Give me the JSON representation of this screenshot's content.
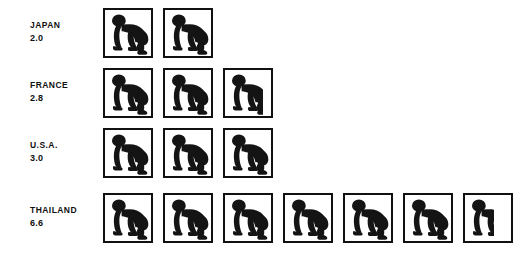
{
  "chart_data": {
    "type": "bar",
    "subtype": "pictogram",
    "title": "",
    "subtitle": "",
    "xlabel": "",
    "ylabel": "",
    "grid": false,
    "legend": "none",
    "orientation": "horizontal",
    "icon": "crawling-baby-icon",
    "icon_unit_value": 1,
    "categories": [
      "JAPAN",
      "FRANCE",
      "U.S.A.",
      "THAILAND"
    ],
    "values": [
      2.0,
      2.8,
      3.0,
      6.6
    ],
    "value_labels": [
      "2.0",
      "2.8",
      "3.0",
      "6.6"
    ],
    "xlim": [
      0,
      7
    ],
    "colors": {
      "icon": "#141414",
      "border": "#111111",
      "background": "#ffffff",
      "text": "#111111"
    },
    "rows": [
      {
        "category": "JAPAN",
        "value": 2.0,
        "value_label": "2.0",
        "full_icons": 2,
        "partial_fraction": 0.0
      },
      {
        "category": "FRANCE",
        "value": 2.8,
        "value_label": "2.8",
        "full_icons": 2,
        "partial_fraction": 0.8
      },
      {
        "category": "U.S.A.",
        "value": 3.0,
        "value_label": "3.0",
        "full_icons": 3,
        "partial_fraction": 0.0
      },
      {
        "category": "THAILAND",
        "value": 6.6,
        "value_label": "6.6",
        "full_icons": 6,
        "partial_fraction": 0.6
      }
    ]
  }
}
